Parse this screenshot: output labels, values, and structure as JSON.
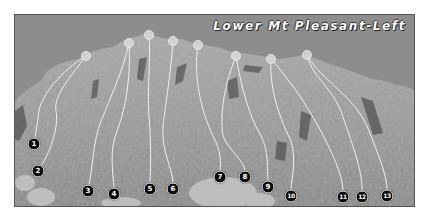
{
  "title": "Lower Mt Pleasant-Left",
  "colors": {
    "sky": "#8d8d8d",
    "rock": "#9e9e9e",
    "route_line": "#f0f0f0",
    "marker_fill": "#0b0b0b",
    "marker_text": "#ffffff",
    "anchor": "#d6d6d6"
  },
  "routes": [
    {
      "number": "1",
      "marker": [
        33,
        143
      ],
      "anchor": [
        85,
        55
      ]
    },
    {
      "number": "2",
      "marker": [
        37,
        170
      ],
      "anchor": [
        85,
        55
      ]
    },
    {
      "number": "3",
      "marker": [
        87,
        190
      ],
      "anchor": [
        128,
        42
      ]
    },
    {
      "number": "4",
      "marker": [
        113,
        193
      ],
      "anchor": [
        128,
        42
      ]
    },
    {
      "number": "5",
      "marker": [
        149,
        188
      ],
      "anchor": [
        148,
        34
      ]
    },
    {
      "number": "6",
      "marker": [
        172,
        188
      ],
      "anchor": [
        172,
        40
      ]
    },
    {
      "number": "7",
      "marker": [
        219,
        176
      ],
      "anchor": [
        197,
        44
      ]
    },
    {
      "number": "8",
      "marker": [
        244,
        176
      ],
      "anchor": [
        235,
        55
      ]
    },
    {
      "number": "9",
      "marker": [
        267,
        186
      ],
      "anchor": [
        235,
        55
      ]
    },
    {
      "number": "10",
      "marker": [
        290,
        195
      ],
      "anchor": [
        270,
        58
      ]
    },
    {
      "number": "11",
      "marker": [
        342,
        196
      ],
      "anchor": [
        270,
        58
      ]
    },
    {
      "number": "12",
      "marker": [
        361,
        196
      ],
      "anchor": [
        306,
        54
      ]
    },
    {
      "number": "13",
      "marker": [
        386,
        195
      ],
      "anchor": [
        306,
        54
      ]
    }
  ]
}
